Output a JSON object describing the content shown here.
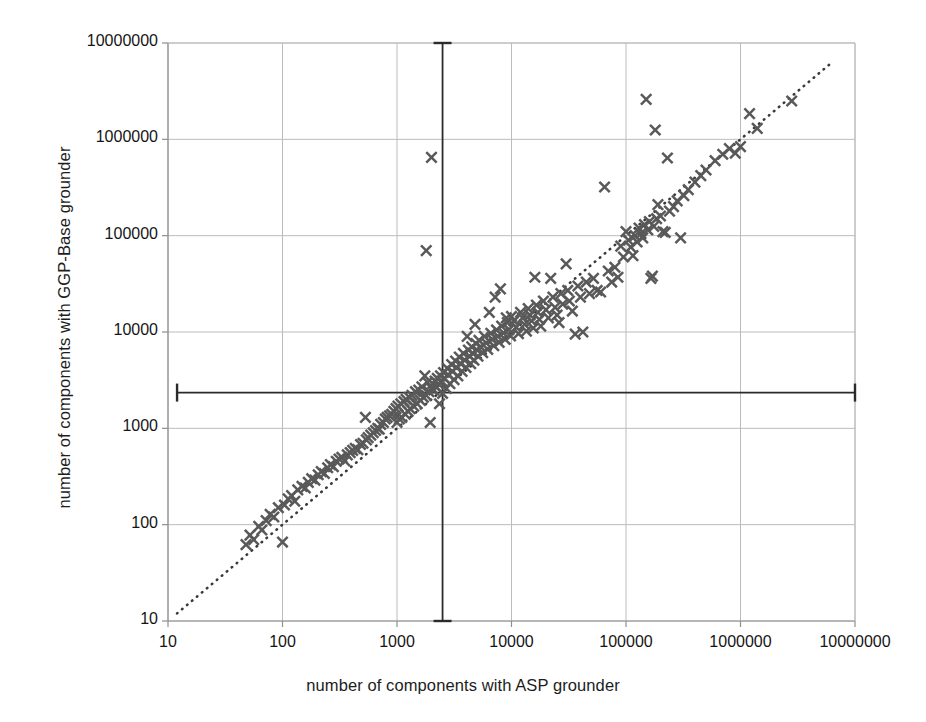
{
  "chart_data": {
    "type": "scatter",
    "title": "",
    "xlabel": "number of components with ASP grounder",
    "ylabel": "number of components with GGP-Base grounder",
    "xscale": "log",
    "yscale": "log",
    "xlim": [
      10,
      10000000
    ],
    "ylim": [
      10,
      10000000
    ],
    "xticks": [
      "10",
      "100",
      "1000",
      "10000",
      "100000",
      "1000000",
      "10000000"
    ],
    "yticks": [
      "10",
      "100",
      "1000",
      "10000",
      "100000",
      "1000000",
      "10000000"
    ],
    "grid": true,
    "legend": "none",
    "marker": "x",
    "marker_color": "#595959",
    "grid_color": "#bcbcbc",
    "axis_color": "#9a9a9a",
    "reference_line": {
      "name": "y = x diagonal",
      "style": "dotted",
      "color": "#3a3a3a",
      "from": [
        12,
        12
      ],
      "to": [
        6000000,
        6000000
      ]
    },
    "annotations": [
      {
        "name": "vertical-median-line",
        "orientation": "vertical",
        "x": 2500,
        "y_from": 10,
        "y_to": 10000000,
        "caps": "both",
        "color": "#2b2b2b"
      },
      {
        "name": "horizontal-median-line",
        "orientation": "horizontal",
        "y": 2350,
        "x_from": 12,
        "x_to": 10000000,
        "caps": "both",
        "color": "#2b2b2b"
      }
    ],
    "series": [
      {
        "name": "instances",
        "marker": "x",
        "points": [
          [
            48,
            62
          ],
          [
            52,
            78
          ],
          [
            56,
            70
          ],
          [
            62,
            96
          ],
          [
            66,
            88
          ],
          [
            72,
            110
          ],
          [
            78,
            128
          ],
          [
            84,
            120
          ],
          [
            92,
            150
          ],
          [
            100,
            66
          ],
          [
            104,
            160
          ],
          [
            112,
            185
          ],
          [
            120,
            200
          ],
          [
            128,
            175
          ],
          [
            136,
            230
          ],
          [
            148,
            250
          ],
          [
            158,
            240
          ],
          [
            168,
            275
          ],
          [
            180,
            300
          ],
          [
            192,
            290
          ],
          [
            205,
            330
          ],
          [
            218,
            355
          ],
          [
            232,
            340
          ],
          [
            248,
            390
          ],
          [
            262,
            420
          ],
          [
            278,
            400
          ],
          [
            295,
            455
          ],
          [
            312,
            480
          ],
          [
            330,
            500
          ],
          [
            350,
            460
          ],
          [
            368,
            530
          ],
          [
            390,
            560
          ],
          [
            410,
            590
          ],
          [
            432,
            620
          ],
          [
            455,
            600
          ],
          [
            480,
            680
          ],
          [
            505,
            700
          ],
          [
            530,
            1300
          ],
          [
            540,
            760
          ],
          [
            560,
            800
          ],
          [
            590,
            850
          ],
          [
            620,
            900
          ],
          [
            650,
            950
          ],
          [
            680,
            1000
          ],
          [
            700,
            980
          ],
          [
            720,
            1100
          ],
          [
            760,
            1150
          ],
          [
            790,
            1250
          ],
          [
            820,
            1300
          ],
          [
            860,
            1350
          ],
          [
            900,
            1400
          ],
          [
            940,
            1500
          ],
          [
            980,
            1600
          ],
          [
            1000,
            1150
          ],
          [
            1020,
            1700
          ],
          [
            1050,
            1250
          ],
          [
            1080,
            1800
          ],
          [
            1100,
            1300
          ],
          [
            1150,
            1900
          ],
          [
            1180,
            1400
          ],
          [
            1200,
            2000
          ],
          [
            1250,
            1500
          ],
          [
            1280,
            2100
          ],
          [
            1300,
            1600
          ],
          [
            1350,
            2200
          ],
          [
            1400,
            1700
          ],
          [
            1450,
            2400
          ],
          [
            1500,
            1800
          ],
          [
            1550,
            2500
          ],
          [
            1600,
            1950
          ],
          [
            1650,
            2700
          ],
          [
            1700,
            2100
          ],
          [
            1750,
            3500
          ],
          [
            1800,
            2200
          ],
          [
            1850,
            3000
          ],
          [
            1800,
            70000
          ],
          [
            1900,
            2400
          ],
          [
            1950,
            1150
          ],
          [
            2000,
            650000
          ],
          [
            2000,
            2600
          ],
          [
            2050,
            2900
          ],
          [
            2100,
            2500
          ],
          [
            2150,
            3100
          ],
          [
            2200,
            2700
          ],
          [
            2250,
            3300
          ],
          [
            2300,
            2900
          ],
          [
            2350,
            1800
          ],
          [
            2400,
            3500
          ],
          [
            2450,
            3100
          ],
          [
            2500,
            2300
          ],
          [
            2550,
            3800
          ],
          [
            2600,
            3300
          ],
          [
            2700,
            2600
          ],
          [
            2750,
            4200
          ],
          [
            2800,
            3600
          ],
          [
            2900,
            2900
          ],
          [
            3000,
            4600
          ],
          [
            3050,
            3900
          ],
          [
            3150,
            3200
          ],
          [
            3250,
            5000
          ],
          [
            3300,
            4300
          ],
          [
            3400,
            3500
          ],
          [
            3500,
            5500
          ],
          [
            3600,
            4700
          ],
          [
            3700,
            3900
          ],
          [
            3800,
            6000
          ],
          [
            3900,
            5100
          ],
          [
            4000,
            4300
          ],
          [
            4100,
            9000
          ],
          [
            4200,
            6500
          ],
          [
            4300,
            5600
          ],
          [
            4400,
            4700
          ],
          [
            4500,
            7000
          ],
          [
            4600,
            6000
          ],
          [
            4700,
            5100
          ],
          [
            4800,
            12000
          ],
          [
            4900,
            7600
          ],
          [
            5000,
            6500
          ],
          [
            5100,
            5600
          ],
          [
            5200,
            8200
          ],
          [
            5400,
            7000
          ],
          [
            5600,
            6100
          ],
          [
            5800,
            9000
          ],
          [
            6000,
            7700
          ],
          [
            6200,
            6600
          ],
          [
            6400,
            16000
          ],
          [
            6600,
            9700
          ],
          [
            6800,
            8400
          ],
          [
            7000,
            7200
          ],
          [
            7200,
            23000
          ],
          [
            7400,
            10500
          ],
          [
            7600,
            9000
          ],
          [
            7800,
            7800
          ],
          [
            8000,
            28000
          ],
          [
            8200,
            11500
          ],
          [
            8500,
            9800
          ],
          [
            8800,
            8400
          ],
          [
            9000,
            14000
          ],
          [
            9200,
            12500
          ],
          [
            9500,
            10600
          ],
          [
            9800,
            9100
          ],
          [
            10000,
            14500
          ],
          [
            10500,
            13000
          ],
          [
            11000,
            11200
          ],
          [
            11500,
            9600
          ],
          [
            12000,
            16000
          ],
          [
            12500,
            14000
          ],
          [
            13000,
            12000
          ],
          [
            13500,
            10200
          ],
          [
            14000,
            17500
          ],
          [
            14500,
            15000
          ],
          [
            15000,
            13000
          ],
          [
            15500,
            11000
          ],
          [
            16000,
            37000
          ],
          [
            16500,
            19000
          ],
          [
            17000,
            16000
          ],
          [
            17500,
            13500
          ],
          [
            18000,
            11500
          ],
          [
            19000,
            21000
          ],
          [
            20000,
            17000
          ],
          [
            21000,
            14000
          ],
          [
            22000,
            36000
          ],
          [
            23000,
            23000
          ],
          [
            24000,
            18000
          ],
          [
            25000,
            15000
          ],
          [
            26000,
            12500
          ],
          [
            27000,
            25000
          ],
          [
            28000,
            19500
          ],
          [
            30000,
            51000
          ],
          [
            31000,
            27000
          ],
          [
            32000,
            21000
          ],
          [
            34000,
            16500
          ],
          [
            36000,
            9500
          ],
          [
            38000,
            30000
          ],
          [
            40000,
            23000
          ],
          [
            42000,
            10000
          ],
          [
            45000,
            33000
          ],
          [
            48000,
            25000
          ],
          [
            52000,
            36000
          ],
          [
            56000,
            27000
          ],
          [
            60000,
            26000
          ],
          [
            65000,
            320000
          ],
          [
            70000,
            43000
          ],
          [
            75000,
            33000
          ],
          [
            80000,
            47000
          ],
          [
            85000,
            37000
          ],
          [
            90000,
            78000
          ],
          [
            95000,
            60000
          ],
          [
            100000,
            110000
          ],
          [
            105000,
            90000
          ],
          [
            110000,
            76000
          ],
          [
            115000,
            62000
          ],
          [
            120000,
            100000
          ],
          [
            125000,
            86000
          ],
          [
            130000,
            120000
          ],
          [
            135000,
            105000
          ],
          [
            140000,
            95000
          ],
          [
            145000,
            130000
          ],
          [
            150000,
            2600000
          ],
          [
            155000,
            115000
          ],
          [
            160000,
            140000
          ],
          [
            165000,
            36000
          ],
          [
            170000,
            38000
          ],
          [
            175000,
            125000
          ],
          [
            180000,
            1250000
          ],
          [
            185000,
            150000
          ],
          [
            190000,
            210000
          ],
          [
            200000,
            160000
          ],
          [
            210000,
            110000
          ],
          [
            220000,
            108000
          ],
          [
            230000,
            640000
          ],
          [
            240000,
            180000
          ],
          [
            260000,
            200000
          ],
          [
            280000,
            230000
          ],
          [
            300000,
            95000
          ],
          [
            320000,
            260000
          ],
          [
            350000,
            300000
          ],
          [
            400000,
            360000
          ],
          [
            450000,
            420000
          ],
          [
            500000,
            480000
          ],
          [
            600000,
            600000
          ],
          [
            700000,
            700000
          ],
          [
            800000,
            800000
          ],
          [
            900000,
            720000
          ],
          [
            1000000,
            840000
          ],
          [
            1200000,
            1850000
          ],
          [
            1400000,
            1300000
          ],
          [
            2800000,
            2500000
          ]
        ]
      }
    ]
  },
  "axes": {
    "x": {
      "title": "number of components with ASP grounder",
      "ticks": [
        "10",
        "100",
        "1000",
        "10000",
        "100000",
        "1000000",
        "10000000"
      ]
    },
    "y": {
      "title": "number of components with GGP-Base grounder",
      "ticks": [
        "10",
        "100",
        "1000",
        "10000",
        "100000",
        "1000000",
        "10000000"
      ]
    }
  }
}
